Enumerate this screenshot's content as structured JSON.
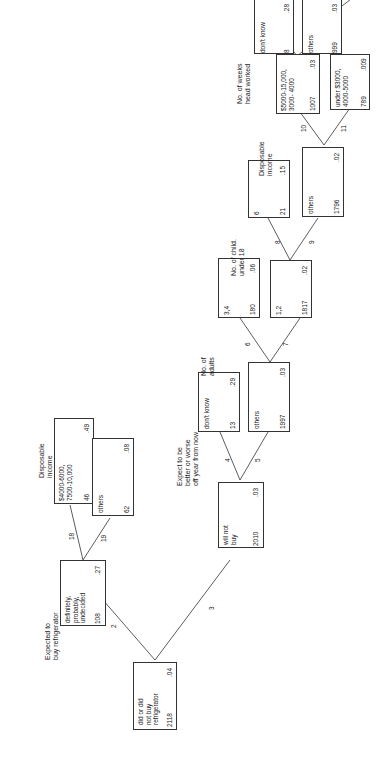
{
  "diagram": {
    "type": "decision-tree",
    "orientation": "rotated-90-ccw",
    "nodes": {
      "root": {
        "label": "did or did\nnot buy\nrefrigerator",
        "count": "2118",
        "rate": ".04"
      },
      "n2": {
        "title": "Expected to\nbuy refrigerator",
        "label": "definitely,\nprobably,\nundecided",
        "count": "108",
        "rate": ".27"
      },
      "n3": {
        "label": "will not\nbuy",
        "count": "2010",
        "rate": ".03"
      },
      "n18": {
        "title": "Disposable\nincome",
        "label": "$4000-6000,\n7500-10,000",
        "count": "46",
        "rate": ".49"
      },
      "n19": {
        "label": "others",
        "count": "62",
        "rate": ".08"
      },
      "n4": {
        "title": "Expect to be\nbetter or worse\noff year from now",
        "label": "don't know",
        "count": "13",
        "rate": ".29"
      },
      "n5": {
        "label": "others",
        "count": "1997",
        "rate": ".03"
      },
      "n6": {
        "title": "No. of\nadults",
        "label": "3,4",
        "count": "180",
        "rate": ".06"
      },
      "n7": {
        "label": "1,2",
        "count": "1817",
        "rate": ".02"
      },
      "n8": {
        "title": "No. of child.\nunder 18",
        "label": "6",
        "count": "21",
        "rate": ".15"
      },
      "n9": {
        "label": "others",
        "count": "1796",
        "rate": ".02"
      },
      "n10": {
        "title": "Disposable\nincome",
        "label": "$5000-15,000,\n3000- 4000",
        "count": "1007",
        "rate": ".03"
      },
      "n11": {
        "label": "under $3000,\n4000-5000",
        "count": "789",
        "rate": ".009"
      },
      "n12": {
        "title": "No. of weeks\nhead worked",
        "label": "don't know",
        "count": "8",
        "rate": ".28"
      },
      "n13": {
        "label": "others",
        "count": "999",
        "rate": ".03"
      }
    },
    "edges": [
      {
        "from": "root",
        "to": "n2",
        "label": "2"
      },
      {
        "from": "root",
        "to": "n3",
        "label": "3"
      },
      {
        "from": "n2",
        "to": "n18",
        "label": "18"
      },
      {
        "from": "n2",
        "to": "n19",
        "label": "19"
      },
      {
        "from": "n3",
        "to": "n4",
        "label": "4"
      },
      {
        "from": "n3",
        "to": "n5",
        "label": "5"
      },
      {
        "from": "n5",
        "to": "n6",
        "label": "6"
      },
      {
        "from": "n5",
        "to": "n7",
        "label": "7"
      },
      {
        "from": "n7",
        "to": "n8",
        "label": "8"
      },
      {
        "from": "n7",
        "to": "n9",
        "label": "9"
      },
      {
        "from": "n9",
        "to": "n10",
        "label": "10"
      },
      {
        "from": "n9",
        "to": "n11",
        "label": "11"
      },
      {
        "from": "n10",
        "to": "n12",
        "label": "12"
      },
      {
        "from": "n10",
        "to": "n13",
        "label": "13"
      }
    ]
  }
}
